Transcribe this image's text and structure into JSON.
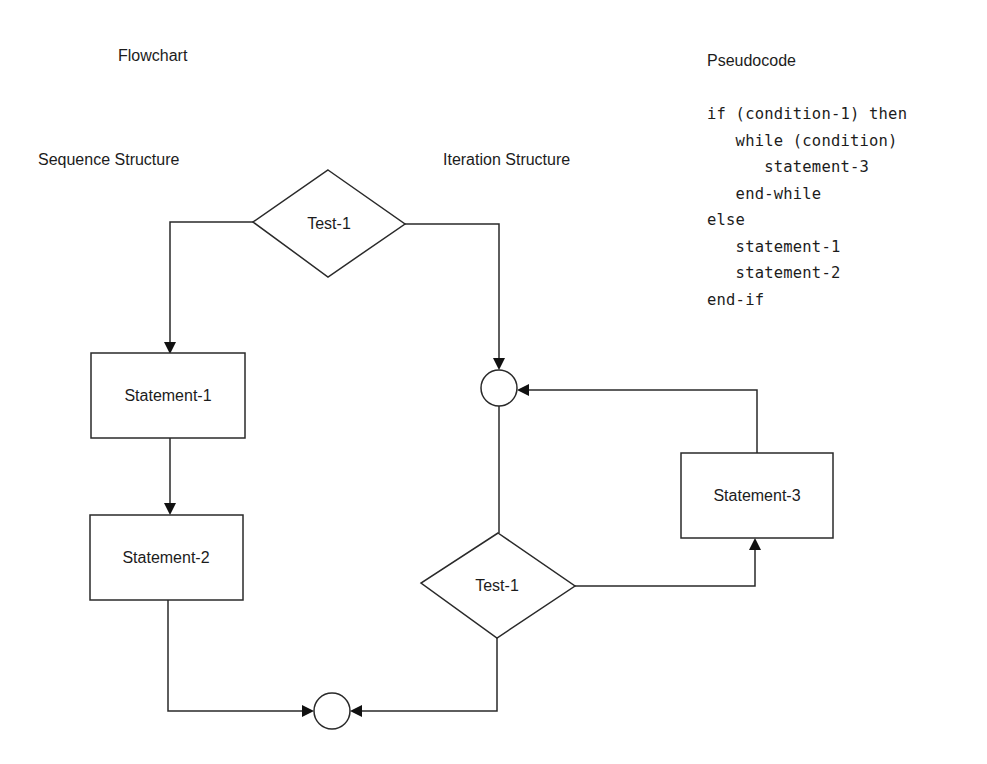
{
  "headings": {
    "flowchart": "Flowchart",
    "pseudocode": "Pseudocode",
    "sequence_structure": "Sequence Structure",
    "iteration_structure": "Iteration Structure"
  },
  "nodes": {
    "decision_top": "Test-1",
    "statement_1": "Statement-1",
    "statement_2": "Statement-2",
    "statement_3": "Statement-3",
    "decision_loop": "Test-1"
  },
  "pseudocode": {
    "lines": [
      "if (condition-1) then",
      "   while (condition)",
      "      statement-3",
      "   end-while",
      "else",
      "   statement-1",
      "   statement-2",
      "end-if"
    ]
  },
  "colors": {
    "background": "#ffffff",
    "stroke": "#2a2a2a",
    "text": "#1c1c1c"
  }
}
